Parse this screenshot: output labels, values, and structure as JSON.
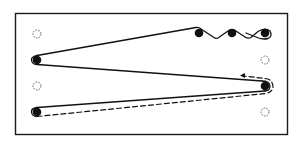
{
  "diagram": {
    "type": "string-threading-pegboard",
    "frame": {
      "x": 15,
      "y": 13,
      "width": 273,
      "height": 122,
      "stroke": "#1a1a1a"
    },
    "colors": {
      "ink": "#111111",
      "empty_peg": "#666666",
      "background": "#ffffff"
    },
    "pegs": [
      {
        "id": "L1",
        "x": 37,
        "y": 34,
        "state": "empty"
      },
      {
        "id": "L2",
        "x": 37,
        "y": 60,
        "state": "filled"
      },
      {
        "id": "L3",
        "x": 37,
        "y": 86,
        "state": "empty"
      },
      {
        "id": "L4",
        "x": 37,
        "y": 112,
        "state": "filled"
      },
      {
        "id": "T1",
        "x": 199,
        "y": 33,
        "state": "filled"
      },
      {
        "id": "T2",
        "x": 232,
        "y": 33,
        "state": "filled"
      },
      {
        "id": "R1",
        "x": 265,
        "y": 33,
        "state": "filled"
      },
      {
        "id": "R2",
        "x": 265,
        "y": 60,
        "state": "empty"
      },
      {
        "id": "R3",
        "x": 265,
        "y": 86,
        "state": "filled"
      },
      {
        "id": "R4",
        "x": 265,
        "y": 112,
        "state": "empty"
      }
    ],
    "paths": [
      {
        "id": "solid-string",
        "style": "solid",
        "description": "String weaving over top pegs, around left peg L2, across to R3, back to L4"
      },
      {
        "id": "dashed-string",
        "style": "dashed",
        "description": "Dashed continuation from L4 back to R3 with arrow pointing left"
      }
    ],
    "arrow": {
      "x": 241,
      "y": 75,
      "direction": "left"
    }
  }
}
